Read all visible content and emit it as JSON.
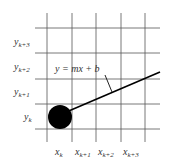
{
  "diagram": {
    "equation": "y = mx + b",
    "y_labels": [
      {
        "base": "y",
        "sub": "k+3"
      },
      {
        "base": "y",
        "sub": "k+2"
      },
      {
        "base": "y",
        "sub": "k+1"
      },
      {
        "base": "y",
        "sub": "k"
      }
    ],
    "x_labels": [
      {
        "base": "x",
        "sub": "k"
      },
      {
        "base": "x",
        "sub": "k+1"
      },
      {
        "base": "x",
        "sub": "k+2"
      },
      {
        "base": "x",
        "sub": "k+3"
      }
    ],
    "colors": {
      "grid": "#555555",
      "line": "#000000",
      "point": "#000000",
      "text": "#333333"
    }
  }
}
